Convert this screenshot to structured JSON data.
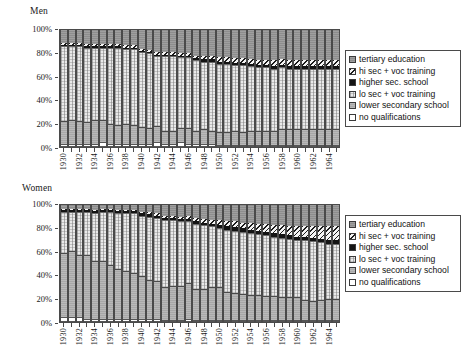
{
  "panels": [
    {
      "title": "Men"
    },
    {
      "title": "Women"
    }
  ],
  "legend": {
    "items": [
      {
        "key": "tertiary",
        "label": "tertiary education",
        "swatch": "tert"
      },
      {
        "key": "hisec",
        "label": "hi sec + voc training",
        "swatch": "hisec"
      },
      {
        "key": "higher",
        "label": "higher sec. school",
        "swatch": "higher"
      },
      {
        "key": "losec",
        "label": "lo sec + voc training",
        "swatch": "losec"
      },
      {
        "key": "lower",
        "label": "lower secondary school",
        "swatch": "lower"
      },
      {
        "key": "none",
        "label": "no qualifications",
        "swatch": "none"
      }
    ]
  },
  "axis": {
    "yticks": [
      "0%",
      "20%",
      "40%",
      "60%",
      "80%",
      "100%"
    ],
    "yvalues": [
      0,
      20,
      40,
      60,
      80,
      100
    ],
    "ylim": [
      0,
      100
    ]
  },
  "chart_data": [
    {
      "type": "bar",
      "title": "Men",
      "stacked": true,
      "percent_stacked": true,
      "xlabel": "",
      "ylabel": "",
      "ylim": [
        0,
        100
      ],
      "grid": false,
      "legend_position": "right",
      "categories": [
        "1930",
        "1931",
        "1932",
        "1933",
        "1934",
        "1935",
        "1936",
        "1937",
        "1938",
        "1939",
        "1940",
        "1941",
        "1942",
        "1943",
        "1944",
        "1945",
        "1946",
        "1947",
        "1948",
        "1949",
        "1950",
        "1951",
        "1952",
        "1953",
        "1954",
        "1955",
        "1956",
        "1957",
        "1958",
        "1959",
        "1960",
        "1961",
        "1962",
        "1963",
        "1964",
        "1965"
      ],
      "tick_labels_every": 2,
      "series": [
        {
          "name": "no qualifications",
          "values": [
            3,
            3,
            3,
            3,
            3,
            4,
            3,
            3,
            3,
            3,
            3,
            3,
            4,
            3,
            3,
            4,
            3,
            3,
            3,
            3,
            2,
            2,
            2,
            2,
            2,
            2,
            2,
            2,
            2,
            2,
            2,
            2,
            2,
            2,
            2,
            2
          ]
        },
        {
          "name": "lower secondary school",
          "values": [
            19,
            20,
            19,
            18,
            20,
            19,
            17,
            16,
            17,
            16,
            14,
            13,
            14,
            11,
            11,
            12,
            13,
            11,
            12,
            11,
            11,
            11,
            12,
            11,
            12,
            12,
            12,
            12,
            13,
            13,
            13,
            13,
            13,
            13,
            13,
            13
          ]
        },
        {
          "name": "lo sec + voc training",
          "values": [
            64,
            63,
            64,
            64,
            62,
            62,
            65,
            66,
            64,
            65,
            64,
            64,
            60,
            64,
            64,
            61,
            61,
            60,
            58,
            59,
            58,
            58,
            56,
            57,
            55,
            54,
            54,
            53,
            53,
            52,
            52,
            52,
            52,
            52,
            52,
            52
          ]
        },
        {
          "name": "higher sec. school",
          "values": [
            1,
            1,
            1,
            1,
            1,
            1,
            1,
            1,
            1,
            1,
            1,
            1,
            1,
            1,
            1,
            1,
            1,
            2,
            2,
            2,
            2,
            2,
            2,
            2,
            2,
            2,
            2,
            2,
            2,
            2,
            2,
            2,
            2,
            2,
            2,
            2
          ]
        },
        {
          "name": "hi sec + voc training",
          "values": [
            2,
            2,
            2,
            2,
            2,
            2,
            2,
            2,
            2,
            2,
            2,
            2,
            2,
            2,
            2,
            2,
            2,
            2,
            3,
            3,
            4,
            4,
            4,
            4,
            4,
            4,
            4,
            5,
            5,
            5,
            5,
            5,
            5,
            5,
            5,
            5
          ]
        },
        {
          "name": "tertiary education",
          "values": [
            11,
            11,
            11,
            12,
            12,
            12,
            12,
            12,
            13,
            13,
            16,
            17,
            19,
            19,
            19,
            20,
            20,
            22,
            22,
            22,
            23,
            23,
            24,
            24,
            25,
            26,
            26,
            26,
            25,
            26,
            26,
            26,
            26,
            26,
            26,
            26
          ]
        }
      ]
    },
    {
      "type": "bar",
      "title": "Women",
      "stacked": true,
      "percent_stacked": true,
      "xlabel": "",
      "ylabel": "",
      "ylim": [
        0,
        100
      ],
      "grid": false,
      "legend_position": "right",
      "categories": [
        "1930",
        "1931",
        "1932",
        "1933",
        "1934",
        "1935",
        "1936",
        "1937",
        "1938",
        "1939",
        "1940",
        "1941",
        "1942",
        "1943",
        "1944",
        "1945",
        "1946",
        "1947",
        "1948",
        "1949",
        "1950",
        "1951",
        "1952",
        "1953",
        "1954",
        "1955",
        "1956",
        "1957",
        "1958",
        "1959",
        "1960",
        "1961",
        "1962",
        "1963",
        "1964",
        "1965"
      ],
      "tick_labels_every": 2,
      "series": [
        {
          "name": "no qualifications",
          "values": [
            4,
            4,
            4,
            3,
            3,
            3,
            3,
            3,
            3,
            3,
            3,
            3,
            3,
            2,
            2,
            2,
            3,
            2,
            2,
            2,
            2,
            2,
            2,
            2,
            2,
            2,
            2,
            2,
            2,
            2,
            2,
            2,
            2,
            2,
            2,
            2
          ]
        },
        {
          "name": "lower secondary school",
          "values": [
            55,
            57,
            53,
            54,
            49,
            49,
            46,
            42,
            41,
            39,
            36,
            33,
            32,
            28,
            29,
            29,
            30,
            26,
            26,
            28,
            28,
            24,
            23,
            22,
            21,
            21,
            20,
            20,
            19,
            19,
            19,
            17,
            16,
            17,
            18,
            18
          ]
        },
        {
          "name": "lo sec + voc training",
          "values": [
            35,
            33,
            37,
            37,
            41,
            42,
            45,
            48,
            49,
            51,
            52,
            54,
            54,
            57,
            56,
            55,
            53,
            56,
            55,
            52,
            50,
            53,
            53,
            53,
            53,
            52,
            52,
            51,
            51,
            50,
            49,
            51,
            51,
            49,
            47,
            47
          ]
        },
        {
          "name": "higher sec. school",
          "values": [
            2,
            2,
            2,
            2,
            2,
            2,
            2,
            2,
            2,
            2,
            2,
            2,
            2,
            2,
            2,
            2,
            2,
            2,
            2,
            2,
            3,
            3,
            3,
            3,
            3,
            3,
            3,
            3,
            3,
            3,
            3,
            3,
            3,
            3,
            3,
            3
          ]
        },
        {
          "name": "hi sec + voc training",
          "values": [
            1,
            1,
            1,
            1,
            1,
            1,
            1,
            1,
            1,
            1,
            1,
            2,
            2,
            2,
            2,
            2,
            3,
            3,
            3,
            3,
            4,
            4,
            5,
            5,
            6,
            6,
            7,
            7,
            8,
            8,
            9,
            9,
            10,
            11,
            12,
            12
          ]
        },
        {
          "name": "tertiary education",
          "values": [
            3,
            3,
            3,
            3,
            4,
            3,
            3,
            4,
            4,
            4,
            6,
            6,
            7,
            9,
            9,
            10,
            9,
            11,
            12,
            13,
            13,
            14,
            14,
            15,
            15,
            16,
            16,
            17,
            17,
            18,
            18,
            18,
            18,
            18,
            18,
            18
          ]
        }
      ]
    }
  ]
}
